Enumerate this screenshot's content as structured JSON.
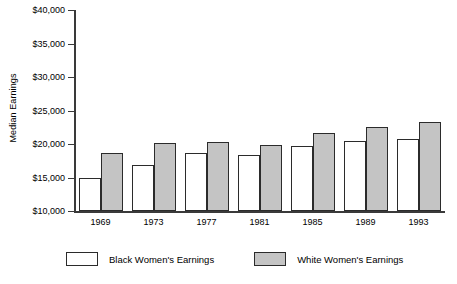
{
  "chart_data": {
    "type": "bar",
    "title": "",
    "xlabel": "",
    "ylabel": "Median Earnings",
    "categories": [
      "1969",
      "1973",
      "1977",
      "1981",
      "1985",
      "1989",
      "1993"
    ],
    "series": [
      {
        "name": "Black Women's Earnings",
        "swatch": "white",
        "color": "#ffffff",
        "values": [
          15000,
          16900,
          18700,
          18400,
          19700,
          20500,
          20700
        ]
      },
      {
        "name": "White Women's Earnings",
        "swatch": "gray",
        "color": "#c4c4c4",
        "values": [
          18700,
          20200,
          20300,
          19800,
          21700,
          22500,
          23300
        ]
      }
    ],
    "ylim": [
      10000,
      40000
    ],
    "ytick_values": [
      10000,
      15000,
      20000,
      25000,
      30000,
      35000,
      40000
    ],
    "ytick_labels": [
      "$10,000",
      "$15,000",
      "$20,000",
      "$25,000",
      "$30,000",
      "$35,000",
      "$40,000"
    ],
    "grid": false,
    "legend_position": "bottom",
    "axis_color": "#3a3a3a",
    "bar_border_color": "#2b2b2b"
  }
}
